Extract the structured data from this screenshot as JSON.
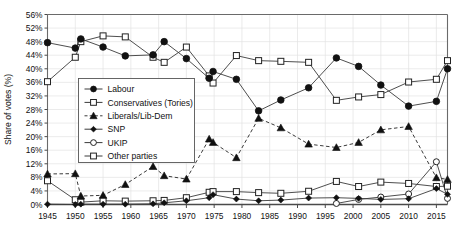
{
  "chart_data": {
    "type": "line",
    "title": "",
    "xlabel": "",
    "ylabel": "Share of votes (%)",
    "xlim": [
      1945,
      2017
    ],
    "ylim": [
      0,
      56
    ],
    "grid": true,
    "legend_position": "inside-left",
    "x_tick_labels": [
      "1945",
      "1950",
      "1955",
      "1960",
      "1965",
      "1970",
      "1975",
      "1980",
      "1985",
      "1990",
      "1995",
      "2000",
      "2005",
      "2010",
      "2015"
    ],
    "x_ticks": [
      1945,
      1950,
      1955,
      1960,
      1965,
      1970,
      1975,
      1980,
      1985,
      1990,
      1995,
      2000,
      2005,
      2010,
      2015
    ],
    "y_tick_labels": [
      "0%",
      "4%",
      "8%",
      "12%",
      "16%",
      "20%",
      "24%",
      "28%",
      "32%",
      "36%",
      "40%",
      "44%",
      "48%",
      "52%",
      "56%"
    ],
    "y_ticks": [
      0,
      4,
      8,
      12,
      16,
      20,
      24,
      28,
      32,
      36,
      40,
      44,
      48,
      52,
      56
    ],
    "x": [
      1945,
      1950,
      1951,
      1955,
      1959,
      1964,
      1966,
      1970,
      1974.1,
      1974.8,
      1979,
      1983,
      1987,
      1992,
      1997,
      2001,
      2005,
      2010,
      2015,
      2017
    ],
    "series": [
      {
        "name": "Labour",
        "marker": "filled-circle",
        "line": "solid",
        "color": "#111111",
        "values": [
          47.7,
          46.1,
          48.8,
          46.4,
          43.8,
          44.1,
          48.0,
          43.0,
          37.2,
          39.2,
          36.9,
          27.6,
          30.8,
          34.4,
          43.2,
          40.7,
          35.2,
          29.0,
          30.4,
          40.0
        ]
      },
      {
        "name": "Conservatives (Tories)",
        "marker": "open-square",
        "line": "solid",
        "color": "#111111",
        "values": [
          36.2,
          43.4,
          48.0,
          49.7,
          49.4,
          43.4,
          41.9,
          46.4,
          37.9,
          35.8,
          43.9,
          42.4,
          42.2,
          41.9,
          30.7,
          31.7,
          32.4,
          36.1,
          36.9,
          42.4
        ]
      },
      {
        "name": "Liberals/Lib-Dem",
        "marker": "filled-triangle",
        "line": "dashed",
        "color": "#111111",
        "values": [
          9.0,
          9.1,
          2.5,
          2.7,
          5.9,
          11.2,
          8.5,
          7.5,
          19.3,
          18.3,
          13.8,
          25.4,
          22.6,
          17.8,
          16.8,
          18.3,
          22.0,
          23.0,
          7.9,
          7.4
        ]
      },
      {
        "name": "SNP",
        "marker": "filled-diamond",
        "line": "solid",
        "color": "#111111",
        "values": [
          0.1,
          0.0,
          0.1,
          0.1,
          0.1,
          0.2,
          0.5,
          1.1,
          2.0,
          2.9,
          1.6,
          1.1,
          1.3,
          1.9,
          2.0,
          1.8,
          1.5,
          1.7,
          4.7,
          3.0
        ]
      },
      {
        "name": "UKIP",
        "marker": "open-circle",
        "line": "solid",
        "color": "#111111",
        "values": [
          0,
          0,
          0,
          0,
          0,
          0,
          0,
          0,
          0,
          0,
          0,
          0,
          0,
          0,
          0.3,
          1.5,
          2.2,
          3.1,
          12.6,
          1.8
        ]
      },
      {
        "name": "Other parties",
        "marker": "open-square",
        "line": "solid",
        "color": "#111111",
        "values": [
          7.0,
          1.4,
          0.7,
          1.1,
          1.0,
          1.1,
          1.2,
          2.0,
          3.6,
          3.8,
          3.8,
          3.5,
          3.3,
          3.9,
          6.8,
          5.3,
          6.6,
          6.2,
          5.3,
          5.4
        ]
      }
    ]
  },
  "legend": {
    "items": [
      {
        "label": "Labour"
      },
      {
        "label": "Conservatives (Tories)"
      },
      {
        "label": "Liberals/Lib-Dem"
      },
      {
        "label": "SNP"
      },
      {
        "label": "UKIP"
      },
      {
        "label": "Other parties"
      }
    ]
  }
}
